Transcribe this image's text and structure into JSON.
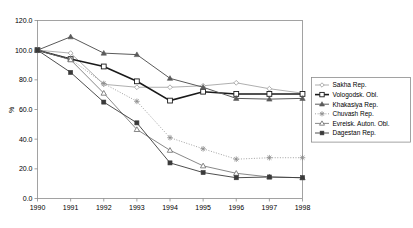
{
  "chart_data": {
    "type": "line",
    "title": "",
    "xlabel": "",
    "ylabel": "%",
    "x": [
      "1990",
      "1991",
      "1992",
      "1993",
      "1994",
      "1995",
      "1996",
      "1997",
      "1998"
    ],
    "categories": [
      "1990",
      "1991",
      "1992",
      "1993",
      "1994",
      "1995",
      "1996",
      "1997",
      "1998"
    ],
    "ylim": [
      0.0,
      120.0
    ],
    "yticks": [
      "0.0",
      "20.0",
      "40.0",
      "60.0",
      "80.0",
      "100.0",
      "120.0"
    ],
    "ytick_values": [
      0.0,
      20.0,
      40.0,
      60.0,
      80.0,
      100.0,
      120.0
    ],
    "grid": false,
    "legend_position": "right",
    "series": [
      {
        "name": "Sakha Rep.",
        "marker": "open-diamond",
        "line_style": "solid",
        "color": "#9a9a9a",
        "values": [
          100.0,
          98.0,
          77.0,
          75.0,
          75.0,
          76.0,
          78.0,
          74.0,
          71.0
        ]
      },
      {
        "name": "Vologodsk. Obl.",
        "marker": "open-square",
        "line_style": "solid",
        "color": "#1a1a1a",
        "values": [
          100.0,
          94.0,
          89.0,
          79.0,
          66.0,
          72.0,
          70.5,
          70.5,
          70.5
        ]
      },
      {
        "name": "Khakasiya Rep.",
        "marker": "filled-triangle",
        "line_style": "solid",
        "color": "#5a5a5a",
        "values": [
          100.0,
          109.0,
          98.0,
          97.0,
          81.0,
          75.0,
          67.5,
          67.0,
          67.5
        ]
      },
      {
        "name": "Chuvash Rep.",
        "marker": "asterisk",
        "line_style": "dotted",
        "color": "#8a8a8a",
        "values": [
          100.0,
          94.0,
          77.5,
          65.5,
          41.0,
          33.5,
          26.5,
          27.5,
          27.5
        ]
      },
      {
        "name": "Evreisk. Auton. Obl.",
        "marker": "open-triangle",
        "line_style": "solid",
        "color": "#6a6a6a",
        "values": [
          100.0,
          93.5,
          71.0,
          46.5,
          32.5,
          22.0,
          17.0,
          14.5,
          14.0
        ]
      },
      {
        "name": "Dagestan Rep.",
        "marker": "filled-square",
        "line_style": "solid",
        "color": "#3a3a3a",
        "values": [
          100.0,
          85.0,
          65.0,
          51.0,
          24.0,
          17.5,
          14.0,
          14.5,
          14.0
        ]
      }
    ]
  },
  "legend": {
    "items": [
      {
        "label": "Sakha Rep."
      },
      {
        "label": "Vologodsk. Obl."
      },
      {
        "label": "Khakasiya Rep."
      },
      {
        "label": "Chuvash Rep."
      },
      {
        "label": "Evreisk. Auton. Obl."
      },
      {
        "label": "Dagestan Rep."
      }
    ]
  }
}
